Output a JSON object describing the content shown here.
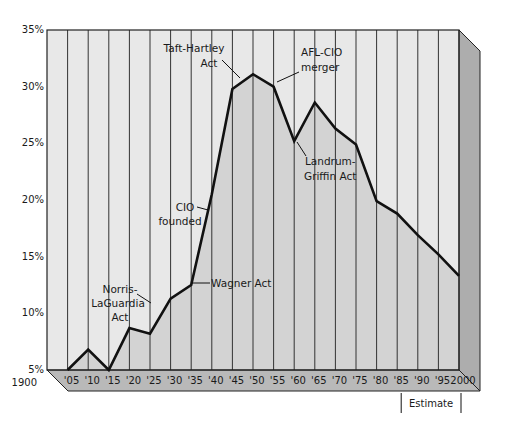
{
  "chart_data": {
    "type": "line",
    "title": "",
    "xlabel": "",
    "ylabel": "",
    "x": [
      1900,
      1905,
      1910,
      1915,
      1920,
      1925,
      1930,
      1935,
      1940,
      1945,
      1950,
      1955,
      1960,
      1965,
      1970,
      1975,
      1980,
      1985,
      1990,
      1995,
      2000
    ],
    "x_tick_labels": [
      "1900",
      "'05",
      "'10",
      "'15",
      "'20",
      "'25",
      "'30",
      "'35",
      "'40",
      "'45",
      "'50",
      "'55",
      "'60",
      "'65",
      "'70",
      "'75",
      "'80",
      "'85",
      "'90",
      "'95",
      "2000"
    ],
    "series": [
      {
        "name": "Union membership (% of workforce)",
        "x": [
          1905,
          1910,
          1915,
          1920,
          1925,
          1930,
          1935,
          1940,
          1945,
          1950,
          1955,
          1960,
          1965,
          1970,
          1975,
          1980,
          1985,
          1990,
          1995,
          2000
        ],
        "values": [
          5.0,
          6.8,
          5.0,
          8.7,
          8.2,
          11.3,
          12.5,
          20.5,
          29.8,
          31.1,
          30.0,
          25.2,
          28.6,
          26.3,
          24.9,
          19.9,
          18.8,
          16.9,
          15.2,
          13.3
        ]
      }
    ],
    "y_tick_labels": [
      "5%",
      "10%",
      "15%",
      "20%",
      "25%",
      "30%",
      "35%"
    ],
    "y_ticks": [
      5,
      10,
      15,
      20,
      25,
      30,
      35
    ],
    "ylim": [
      5,
      35
    ],
    "xlim": [
      1900,
      2000
    ],
    "grid": {
      "vertical": true,
      "horizontal": false
    },
    "annotations": [
      {
        "text": [
          "Norris-",
          "LaGuardia",
          "Act"
        ],
        "year": 1932
      },
      {
        "text": [
          "Wagner Act"
        ],
        "year": 1935
      },
      {
        "text": [
          "CIO",
          "founded"
        ],
        "year": 1938
      },
      {
        "text": [
          "Taft-Hartley",
          "Act"
        ],
        "year": 1947
      },
      {
        "text": [
          "AFL-CIO",
          "merger"
        ],
        "year": 1955
      },
      {
        "text": [
          "Landrum-",
          "Griffin Act"
        ],
        "year": 1959
      }
    ],
    "estimate_bracket": {
      "label": "Estimate",
      "from": 1985,
      "to": 2000
    },
    "legend": null
  },
  "colors": {
    "plot_bg": "#e8e8e8",
    "area_fill": "#d3d3d3",
    "band": "#b9b9b9",
    "side": "#adadad",
    "line": "#111111",
    "grid": "#333333"
  }
}
